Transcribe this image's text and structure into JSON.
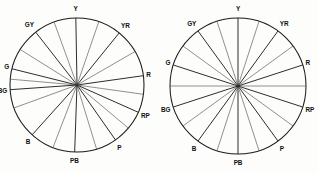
{
  "figure": {
    "background_color": "#fdfdfc",
    "line_color": "#1c1c1c",
    "spoke_color": "#4a4a4a"
  },
  "chart_data": {
    "type": "scatter",
    "xlabel": "",
    "ylabel": "",
    "grid": false,
    "legend": null,
    "panels": [
      {
        "name": "left-hue-circle",
        "center_x": 77,
        "center_y": 85,
        "radius": 67,
        "description": "hue circle with perceptually irregular spoke spacing",
        "principal_hues": [
          {
            "label": "R",
            "angle_deg": 8
          },
          {
            "label": "YR",
            "angle_deg": 51
          },
          {
            "label": "Y",
            "angle_deg": 91
          },
          {
            "label": "GY",
            "angle_deg": 128
          },
          {
            "label": "G",
            "angle_deg": 166
          },
          {
            "label": "BG",
            "angle_deg": 184
          },
          {
            "label": "B",
            "angle_deg": 228
          },
          {
            "label": "PB",
            "angle_deg": 268
          },
          {
            "label": "P",
            "angle_deg": 305
          },
          {
            "label": "RP",
            "angle_deg": 336
          }
        ],
        "spoke_angles_deg": [
          8,
          30,
          51,
          71,
          91,
          110,
          128,
          148,
          166,
          175,
          184,
          200,
          228,
          249,
          268,
          287,
          305,
          320,
          336,
          352
        ]
      },
      {
        "name": "right-hue-circle",
        "center_x": 79,
        "center_y": 86,
        "radius": 68,
        "description": "hue circle with near-uniform spoke spacing",
        "principal_hues": [
          {
            "label": "R",
            "angle_deg": 18
          },
          {
            "label": "YR",
            "angle_deg": 54
          },
          {
            "label": "Y",
            "angle_deg": 90
          },
          {
            "label": "GY",
            "angle_deg": 126
          },
          {
            "label": "G",
            "angle_deg": 162
          },
          {
            "label": "BG",
            "angle_deg": 198
          },
          {
            "label": "B",
            "angle_deg": 234
          },
          {
            "label": "PB",
            "angle_deg": 270
          },
          {
            "label": "P",
            "angle_deg": 306
          },
          {
            "label": "RP",
            "angle_deg": 342
          }
        ],
        "spoke_angles_deg": [
          0,
          18,
          36,
          54,
          72,
          90,
          108,
          126,
          144,
          162,
          180,
          198,
          216,
          234,
          252,
          270,
          288,
          306,
          324,
          342
        ]
      }
    ]
  }
}
